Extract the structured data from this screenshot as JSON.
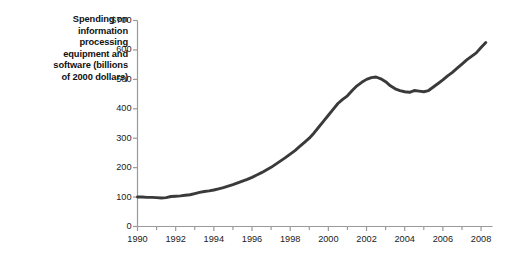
{
  "figure": {
    "axis_label_lines": [
      "Spending on",
      "information",
      "processing",
      "equipment and",
      "software (billions",
      "of 2000 dollars)"
    ],
    "line_color": "#3a3a3a",
    "axis_color": "#9a9a9a",
    "text_color": "#1a1a1a",
    "background": "#ffffff"
  },
  "chart_data": {
    "type": "line",
    "title": "",
    "subtitle": "",
    "xlabel": "",
    "ylabel": "Spending on information processing equipment and software (billions of 2000 dollars)",
    "xlim": [
      1990,
      2008.6
    ],
    "ylim": [
      0,
      700
    ],
    "grid": false,
    "legend": "none",
    "y_ticks": [
      0,
      100,
      200,
      300,
      400,
      500,
      600,
      700
    ],
    "y_tick_labels": [
      "0",
      "100",
      "200",
      "300",
      "400",
      "500",
      "600",
      "$700"
    ],
    "x_ticks": [
      1990,
      1992,
      1994,
      1996,
      1998,
      2000,
      2002,
      2004,
      2006,
      2008
    ],
    "x_tick_labels": [
      "1990",
      "1992",
      "1994",
      "1996",
      "1998",
      "2000",
      "2002",
      "2004",
      "2006",
      "2008"
    ],
    "x_minor_ticks": [
      1991,
      1993,
      1995,
      1997,
      1999,
      2001,
      2003,
      2005,
      2007
    ],
    "series": [
      {
        "name": "Spending on information processing equipment and software",
        "color": "#3a3a3a",
        "x": [
          1990.0,
          1990.25,
          1990.5,
          1990.75,
          1991.0,
          1991.25,
          1991.5,
          1991.75,
          1992.0,
          1992.25,
          1992.5,
          1992.75,
          1993.0,
          1993.25,
          1993.5,
          1993.75,
          1994.0,
          1994.25,
          1994.5,
          1994.75,
          1995.0,
          1995.25,
          1995.5,
          1995.75,
          1996.0,
          1996.25,
          1996.5,
          1996.75,
          1997.0,
          1997.25,
          1997.5,
          1997.75,
          1998.0,
          1998.25,
          1998.5,
          1998.75,
          1999.0,
          1999.25,
          1999.5,
          1999.75,
          2000.0,
          2000.25,
          2000.5,
          2000.75,
          2001.0,
          2001.25,
          2001.5,
          2001.75,
          2002.0,
          2002.25,
          2002.5,
          2002.75,
          2003.0,
          2003.25,
          2003.5,
          2003.75,
          2004.0,
          2004.25,
          2004.5,
          2004.75,
          2005.0,
          2005.25,
          2005.5,
          2005.75,
          2006.0,
          2006.25,
          2006.5,
          2006.75,
          2007.0,
          2007.25,
          2007.5,
          2007.75,
          2008.0,
          2008.25
        ],
        "y": [
          100,
          100,
          99,
          99,
          98,
          97,
          98,
          102,
          103,
          104,
          106,
          108,
          112,
          116,
          119,
          121,
          124,
          128,
          132,
          137,
          142,
          148,
          154,
          160,
          167,
          175,
          183,
          192,
          201,
          212,
          223,
          234,
          246,
          258,
          272,
          286,
          300,
          318,
          338,
          358,
          378,
          398,
          418,
          432,
          444,
          462,
          478,
          490,
          500,
          506,
          508,
          502,
          492,
          478,
          468,
          462,
          458,
          456,
          462,
          460,
          458,
          462,
          474,
          486,
          498,
          512,
          524,
          538,
          552,
          566,
          578,
          590,
          608,
          625
        ]
      }
    ],
    "annotations": []
  }
}
